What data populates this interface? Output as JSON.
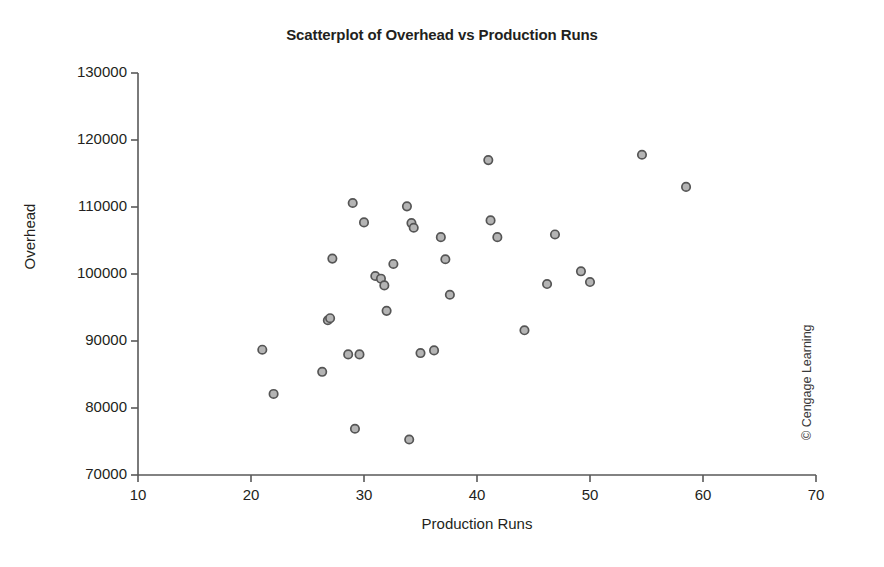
{
  "chart_data": {
    "type": "scatter",
    "title": "Scatterplot of Overhead vs Production Runs",
    "xlabel": "Production Runs",
    "ylabel": "Overhead",
    "xlim": [
      10,
      70
    ],
    "ylim": [
      70000,
      130000
    ],
    "xticks": [
      10,
      20,
      30,
      40,
      50,
      60,
      70
    ],
    "yticks": [
      70000,
      80000,
      90000,
      100000,
      110000,
      120000,
      130000
    ],
    "xtick_labels": [
      "10",
      "20",
      "30",
      "40",
      "50",
      "60",
      "70"
    ],
    "ytick_labels": [
      "70000",
      "80000",
      "90000",
      "100000",
      "110000",
      "120000",
      "130000"
    ],
    "grid": false,
    "legend": null,
    "legend_position": "none",
    "marker": {
      "shape": "circle",
      "fill_color": "#b4b4b4",
      "edge_color": "#555555",
      "radius": 4.2
    },
    "series": [
      {
        "name": "Overhead vs Production Runs",
        "points": [
          {
            "x": 21.0,
            "y": 88700
          },
          {
            "x": 22.0,
            "y": 82100
          },
          {
            "x": 26.3,
            "y": 85400
          },
          {
            "x": 26.8,
            "y": 93100
          },
          {
            "x": 27.0,
            "y": 93400
          },
          {
            "x": 27.2,
            "y": 102300
          },
          {
            "x": 28.6,
            "y": 88000
          },
          {
            "x": 29.0,
            "y": 110600
          },
          {
            "x": 29.2,
            "y": 76900
          },
          {
            "x": 29.6,
            "y": 88000
          },
          {
            "x": 30.0,
            "y": 107700
          },
          {
            "x": 31.0,
            "y": 99700
          },
          {
            "x": 31.5,
            "y": 99300
          },
          {
            "x": 31.8,
            "y": 98300
          },
          {
            "x": 32.0,
            "y": 94500
          },
          {
            "x": 32.6,
            "y": 101500
          },
          {
            "x": 33.8,
            "y": 110100
          },
          {
            "x": 34.0,
            "y": 75300
          },
          {
            "x": 34.2,
            "y": 107600
          },
          {
            "x": 34.4,
            "y": 106900
          },
          {
            "x": 35.0,
            "y": 88200
          },
          {
            "x": 36.2,
            "y": 88600
          },
          {
            "x": 36.8,
            "y": 105500
          },
          {
            "x": 37.2,
            "y": 102200
          },
          {
            "x": 37.6,
            "y": 96900
          },
          {
            "x": 41.0,
            "y": 117000
          },
          {
            "x": 41.2,
            "y": 108000
          },
          {
            "x": 41.8,
            "y": 105500
          },
          {
            "x": 44.2,
            "y": 91600
          },
          {
            "x": 46.2,
            "y": 98500
          },
          {
            "x": 46.9,
            "y": 105900
          },
          {
            "x": 49.2,
            "y": 100400
          },
          {
            "x": 50.0,
            "y": 98800
          },
          {
            "x": 54.6,
            "y": 117800
          },
          {
            "x": 58.5,
            "y": 113000
          }
        ]
      }
    ]
  },
  "figure": {
    "title": "Scatterplot of Overhead vs Production Runs",
    "xlabel": "Production Runs",
    "ylabel": "Overhead",
    "copyright": "© Cengage Learning"
  },
  "colors": {
    "axis": "#595959",
    "text": "#231f20",
    "marker_fill": "#b4b4b4",
    "marker_edge": "#555555",
    "background": "#ffffff"
  }
}
